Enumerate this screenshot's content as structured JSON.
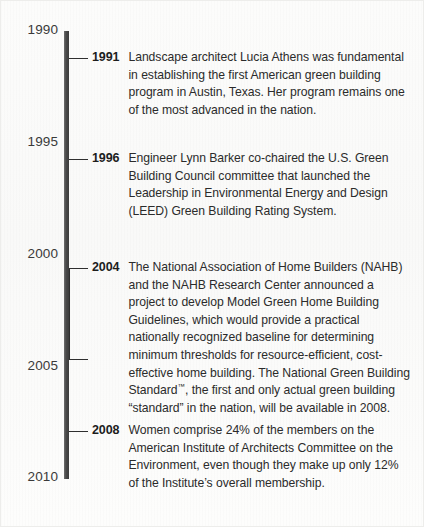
{
  "figure": {
    "type": "timeline",
    "orientation": "vertical",
    "axis_start_year": 1990,
    "axis_end_year": 2010,
    "colors": {
      "axis": "#4a4a4a",
      "marker": "#2f2f2f",
      "year_text": "#1d1d1d",
      "body_text": "#2b2b2b",
      "axis_label_text": "#3a3a3a",
      "background": "#fbfbfa"
    }
  },
  "axis": {
    "labels": [
      {
        "text": "1990",
        "year": 1990
      },
      {
        "text": "1995",
        "year": 1995
      },
      {
        "text": "2000",
        "year": 2000
      },
      {
        "text": "2005",
        "year": 2005
      },
      {
        "text": "2010",
        "year": 2010
      }
    ]
  },
  "events": [
    {
      "year": "1991",
      "marker": "dash",
      "text": "Landscape architect Lucia Athens was fundamental in establishing the first American green building program in Austin, Texas. Her program remains one of the most advanced in the nation."
    },
    {
      "year": "1996",
      "marker": "dash",
      "text": "Engineer Lynn Barker co-chaired the U.S. Green Building Council committee that launched the Leadership in Environmental Energy and Design (LEED) Green Building Rating System."
    },
    {
      "year": "2004",
      "marker": "bracket",
      "text_before_tm": "The National Association of Home Builders (NAHB) and the NAHB Research Center announced a project to develop Model Green Home Building Guidelines, which would provide a practical nationally recognized baseline for determining minimum thresholds for resource-efficient, cost-effective home building. The National Green Building Standard",
      "tm_symbol": "™",
      "text_after_tm": ", the first and only actual green building “standard” in the nation, will be available in 2008."
    },
    {
      "year": "2008",
      "marker": "dash",
      "text": "Women comprise 24% of the members on the American Institute of Architects Committee on the Environment, even though they make up only 12% of the Institute’s overall membership."
    }
  ]
}
